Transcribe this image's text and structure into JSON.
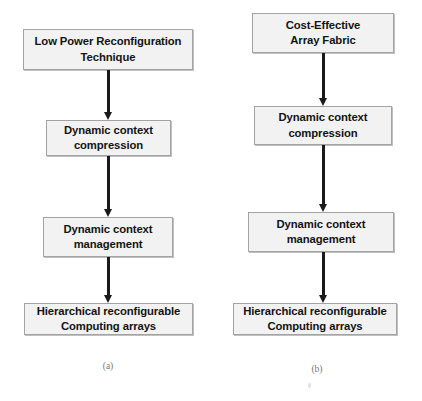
{
  "figure": {
    "background_color": "#ffffff",
    "node_fill_color": "#f2f2f2",
    "node_border_color": "#a3a3a3",
    "arrow_color": "#1a1a1a",
    "caption_color": "#777777"
  },
  "diagrams": [
    {
      "id": "diagram-a",
      "caption": "(a)",
      "nodes": [
        {
          "id": "a-node-1",
          "label": "Low Power Reconfiguration\nTechnique"
        },
        {
          "id": "a-node-2",
          "label": "Dynamic context\ncompression"
        },
        {
          "id": "a-node-3",
          "label": "Dynamic context\nmanagement"
        },
        {
          "id": "a-node-4",
          "label": "Hierarchical reconfigurable\nComputing arrays"
        }
      ],
      "connectors": [
        {
          "id": "a-arrow-1",
          "from": "a-node-1",
          "to": "a-node-2",
          "direction": "down"
        },
        {
          "id": "a-arrow-2",
          "from": "a-node-2",
          "to": "a-node-3",
          "direction": "down"
        },
        {
          "id": "a-arrow-3",
          "from": "a-node-3",
          "to": "a-node-4",
          "direction": "down"
        }
      ]
    },
    {
      "id": "diagram-b",
      "caption": "(b)",
      "nodes": [
        {
          "id": "b-node-1",
          "label": "Cost-Effective\nArray Fabric"
        },
        {
          "id": "b-node-2",
          "label": "Dynamic context\ncompression"
        },
        {
          "id": "b-node-3",
          "label": "Dynamic context\nmanagement"
        },
        {
          "id": "b-node-4",
          "label": "Hierarchical reconfigurable\nComputing arrays"
        }
      ],
      "connectors": [
        {
          "id": "b-arrow-1",
          "from": "b-node-1",
          "to": "b-node-2",
          "direction": "down"
        },
        {
          "id": "b-arrow-2",
          "from": "b-node-2",
          "to": "b-node-3",
          "direction": "down"
        },
        {
          "id": "b-arrow-3",
          "from": "b-node-3",
          "to": "b-node-4",
          "direction": "down"
        }
      ]
    }
  ]
}
